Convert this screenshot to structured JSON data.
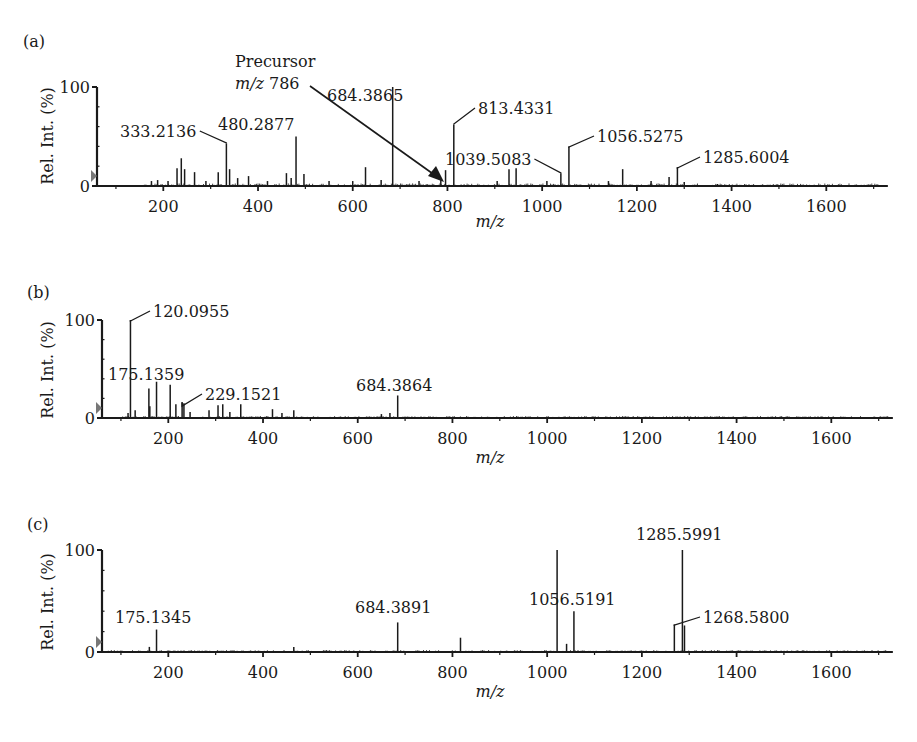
{
  "figure": {
    "panels": [
      {
        "letter": "(a)",
        "ylabel": "Rel. Int. (%)",
        "xlabel": "m/z"
      },
      {
        "letter": "(b)",
        "ylabel": "Rel. Int. (%)",
        "xlabel": "m/z"
      },
      {
        "letter": "(c)",
        "ylabel": "Rel. Int. (%)",
        "xlabel": "m/z"
      }
    ],
    "precursor_annotation": {
      "line1": "Precursor",
      "line2_italic": "m/z",
      "line2_value": "786"
    }
  },
  "chart_data": [
    {
      "type": "bar",
      "panel": "(a)",
      "title": "",
      "xlabel": "m/z",
      "ylabel": "Rel. Int. (%)",
      "xlim": [
        60,
        1730
      ],
      "ylim": [
        0,
        100
      ],
      "xticks": [
        200,
        400,
        600,
        800,
        1000,
        1200,
        1400,
        1600
      ],
      "yticks": [
        0,
        100
      ],
      "grid": false,
      "annotation": "Precursor m/z 786 (arrow)",
      "peaks": [
        {
          "mz": 175,
          "int": 5
        },
        {
          "mz": 188,
          "int": 6
        },
        {
          "mz": 210,
          "int": 5
        },
        {
          "mz": 229,
          "int": 18
        },
        {
          "mz": 238,
          "int": 28
        },
        {
          "mz": 245,
          "int": 17
        },
        {
          "mz": 266,
          "int": 14
        },
        {
          "mz": 290,
          "int": 5
        },
        {
          "mz": 316,
          "int": 14
        },
        {
          "mz": 333.2136,
          "int": 43,
          "label": "333.2136"
        },
        {
          "mz": 340,
          "int": 17
        },
        {
          "mz": 357,
          "int": 8
        },
        {
          "mz": 380,
          "int": 10
        },
        {
          "mz": 420,
          "int": 5
        },
        {
          "mz": 460,
          "int": 13
        },
        {
          "mz": 470,
          "int": 8
        },
        {
          "mz": 480.2877,
          "int": 50,
          "label": "480.2877"
        },
        {
          "mz": 497,
          "int": 12
        },
        {
          "mz": 550,
          "int": 5
        },
        {
          "mz": 600,
          "int": 5
        },
        {
          "mz": 627,
          "int": 19
        },
        {
          "mz": 660,
          "int": 6
        },
        {
          "mz": 684.3865,
          "int": 100,
          "label": "684.3865"
        },
        {
          "mz": 740,
          "int": 5
        },
        {
          "mz": 786,
          "int": 6
        },
        {
          "mz": 796,
          "int": 16
        },
        {
          "mz": 813.4331,
          "int": 62,
          "label": "813.4331"
        },
        {
          "mz": 905,
          "int": 5
        },
        {
          "mz": 930,
          "int": 17
        },
        {
          "mz": 945,
          "int": 18
        },
        {
          "mz": 1010,
          "int": 5
        },
        {
          "mz": 1039.5083,
          "int": 13,
          "label": "1039.5083"
        },
        {
          "mz": 1056.5275,
          "int": 40,
          "label": "1056.5275"
        },
        {
          "mz": 1140,
          "int": 5
        },
        {
          "mz": 1170,
          "int": 17
        },
        {
          "mz": 1230,
          "int": 5
        },
        {
          "mz": 1268,
          "int": 9
        },
        {
          "mz": 1285.6004,
          "int": 19,
          "label": "1285.6004"
        },
        {
          "mz": 1300,
          "int": 4
        },
        {
          "mz": 1370,
          "int": 2
        }
      ]
    },
    {
      "type": "bar",
      "panel": "(b)",
      "title": "",
      "xlabel": "m/z",
      "ylabel": "Rel. Int. (%)",
      "xlim": [
        60,
        1730
      ],
      "ylim": [
        0,
        100
      ],
      "xticks": [
        200,
        400,
        600,
        800,
        1000,
        1200,
        1400,
        1600
      ],
      "yticks": [
        0,
        100
      ],
      "grid": false,
      "peaks": [
        {
          "mz": 115,
          "int": 5
        },
        {
          "mz": 120.0955,
          "int": 100,
          "label": "120.0955"
        },
        {
          "mz": 130,
          "int": 8
        },
        {
          "mz": 159,
          "int": 30
        },
        {
          "mz": 161,
          "int": 12
        },
        {
          "mz": 175.1359,
          "int": 37,
          "label": "175.1359"
        },
        {
          "mz": 204,
          "int": 34
        },
        {
          "mz": 216,
          "int": 14
        },
        {
          "mz": 229.1521,
          "int": 16,
          "label": "229.1521"
        },
        {
          "mz": 233,
          "int": 15
        },
        {
          "mz": 246,
          "int": 6
        },
        {
          "mz": 286,
          "int": 8
        },
        {
          "mz": 305,
          "int": 13
        },
        {
          "mz": 315,
          "int": 14
        },
        {
          "mz": 330,
          "int": 6
        },
        {
          "mz": 353,
          "int": 14
        },
        {
          "mz": 420,
          "int": 9
        },
        {
          "mz": 440,
          "int": 5
        },
        {
          "mz": 465,
          "int": 8
        },
        {
          "mz": 650,
          "int": 4
        },
        {
          "mz": 668,
          "int": 5
        },
        {
          "mz": 684.3864,
          "int": 23,
          "label": "684.3864"
        }
      ]
    },
    {
      "type": "bar",
      "panel": "(c)",
      "title": "",
      "xlabel": "m/z",
      "ylabel": "Rel. Int. (%)",
      "xlim": [
        60,
        1730
      ],
      "ylim": [
        0,
        100
      ],
      "xticks": [
        200,
        400,
        600,
        800,
        1000,
        1200,
        1400,
        1600
      ],
      "yticks": [
        0,
        100
      ],
      "grid": false,
      "peaks": [
        {
          "mz": 160,
          "int": 5
        },
        {
          "mz": 175.1345,
          "int": 22,
          "label": "175.1345"
        },
        {
          "mz": 465,
          "int": 5
        },
        {
          "mz": 684.3891,
          "int": 29,
          "label": "684.3891"
        },
        {
          "mz": 817,
          "int": 14
        },
        {
          "mz": 1021,
          "int": 100
        },
        {
          "mz": 1041,
          "int": 8
        },
        {
          "mz": 1056.5191,
          "int": 40,
          "label": "1056.5191"
        },
        {
          "mz": 1268.58,
          "int": 27,
          "label": "1268.5800"
        },
        {
          "mz": 1285.5991,
          "int": 100,
          "label": "1285.5991"
        },
        {
          "mz": 1290,
          "int": 26
        }
      ]
    }
  ],
  "layout": {
    "panels": [
      {
        "y0": 186,
        "y100": 87,
        "x0": 97,
        "label_positions": {
          "333.2136": [
            120,
            137,
            "leader",
            226,
            143
          ],
          "480.2877": [
            218,
            130,
            "none",
            0,
            0
          ],
          "684.3865": [
            327,
            101,
            "none",
            0,
            0
          ],
          "813.4331": [
            478,
            114,
            "leader",
            455,
            124
          ],
          "1039.5083": [
            445,
            165,
            "leader",
            562,
            173
          ],
          "1056.5275": [
            597,
            142,
            "leader",
            569,
            147
          ],
          "1285.6004": [
            703,
            163,
            "leader",
            677,
            168
          ]
        }
      },
      {
        "y0": 418,
        "y100": 320,
        "x0": 102,
        "label_positions": {
          "120.0955": [
            153,
            317,
            "leader",
            130,
            321
          ],
          "175.1359": [
            108,
            380,
            "none",
            0,
            0
          ],
          "229.1521": [
            205,
            400,
            "leader",
            183,
            406
          ],
          "684.3864": [
            356,
            391,
            "none",
            0,
            0
          ]
        }
      },
      {
        "y0": 652,
        "y100": 550,
        "x0": 102,
        "label_positions": {
          "175.1345": [
            115,
            623,
            "none",
            0,
            0
          ],
          "684.3891": [
            355,
            613,
            "none",
            0,
            0
          ],
          "1056.5191": [
            529,
            605,
            "none",
            0,
            0
          ],
          "1268.5800": [
            703,
            623,
            "leader",
            677,
            625
          ],
          "1285.5991": [
            636,
            540,
            "none",
            0,
            0
          ]
        }
      }
    ]
  }
}
